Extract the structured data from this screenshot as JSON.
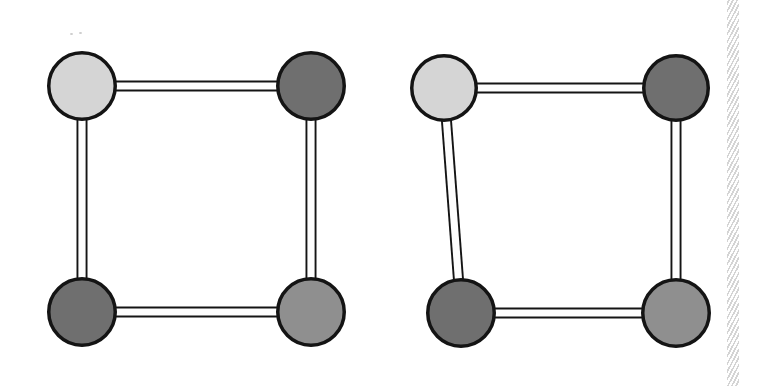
{
  "figure": {
    "title": "Two four-node square graphs",
    "background_color": "#ffffff",
    "width": 764,
    "height": 386,
    "node_outline_color": "#141414",
    "node_outline_width": 3.5,
    "edge_fill_color": "#fdfdfd",
    "edge_outline_color": "#141414",
    "edge_outline_width": 2.2,
    "edge_thickness": 11,
    "palette": {
      "light_gray": "#d5d5d5",
      "dark_gray": "#6f6f6f",
      "mid_gray": "#8f8f8f"
    },
    "graphs": [
      {
        "id": "graph-left",
        "label": "Left graph",
        "nodes": [
          {
            "id": "n1",
            "label": "top-left",
            "cx": 82,
            "cy": 86,
            "r": 35,
            "fill": "#d5d5d5",
            "shade": "light-gray"
          },
          {
            "id": "n2",
            "label": "top-right",
            "cx": 311,
            "cy": 86,
            "r": 35,
            "fill": "#6f6f6f",
            "shade": "dark-gray"
          },
          {
            "id": "n3",
            "label": "bottom-left",
            "cx": 82,
            "cy": 312,
            "r": 35,
            "fill": "#6f6f6f",
            "shade": "dark-gray"
          },
          {
            "id": "n4",
            "label": "bottom-right",
            "cx": 311,
            "cy": 312,
            "r": 35,
            "fill": "#8f8f8f",
            "shade": "mid-gray"
          }
        ],
        "edges": [
          {
            "id": "e1",
            "label": "top edge",
            "from": "n1",
            "to": "n2"
          },
          {
            "id": "e2",
            "label": "left edge",
            "from": "n1",
            "to": "n3"
          },
          {
            "id": "e3",
            "label": "right edge",
            "from": "n2",
            "to": "n4"
          },
          {
            "id": "e4",
            "label": "bottom edge",
            "from": "n3",
            "to": "n4"
          }
        ]
      },
      {
        "id": "graph-right",
        "label": "Right graph",
        "nodes": [
          {
            "id": "m1",
            "label": "top-left",
            "cx": 444,
            "cy": 88,
            "r": 34,
            "fill": "#d5d5d5",
            "shade": "light-gray"
          },
          {
            "id": "m2",
            "label": "top-right",
            "cx": 676,
            "cy": 88,
            "r": 34,
            "fill": "#6f6f6f",
            "shade": "dark-gray"
          },
          {
            "id": "m3",
            "label": "bottom-left",
            "cx": 461,
            "cy": 313,
            "r": 35,
            "fill": "#6f6f6f",
            "shade": "dark-gray"
          },
          {
            "id": "m4",
            "label": "bottom-right",
            "cx": 676,
            "cy": 313,
            "r": 35,
            "fill": "#8f8f8f",
            "shade": "mid-gray"
          }
        ],
        "edges": [
          {
            "id": "f1",
            "label": "top edge",
            "from": "m1",
            "to": "m2"
          },
          {
            "id": "f2",
            "label": "left edge",
            "from": "m1",
            "to": "m3"
          },
          {
            "id": "f3",
            "label": "right edge",
            "from": "m2",
            "to": "m4"
          },
          {
            "id": "f4",
            "label": "bottom edge",
            "from": "m3",
            "to": "m4"
          }
        ]
      }
    ],
    "page_edge_hatch": {
      "label": "page-edge-hatching",
      "x": 727,
      "width": 12,
      "color": "#b8b8b8"
    },
    "scan_specks": [
      {
        "label": "speck-a",
        "x": 70,
        "y": 33,
        "w": 3,
        "h": 2
      },
      {
        "label": "speck-b",
        "x": 79,
        "y": 32,
        "w": 3,
        "h": 2
      }
    ]
  }
}
